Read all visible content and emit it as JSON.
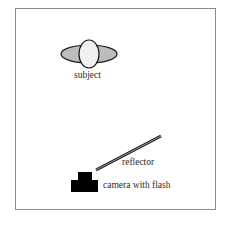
{
  "diagram": {
    "type": "lighting-setup",
    "labels": {
      "subject": "subject",
      "reflector": "reflector",
      "camera": "camera with flash"
    },
    "colors": {
      "frame": "#8a8a8a",
      "head_fill": "#f0f0f0",
      "shoulder_fill": "#bdbdbd",
      "outline": "#1a1a1a",
      "camera_fill": "#000000"
    }
  }
}
